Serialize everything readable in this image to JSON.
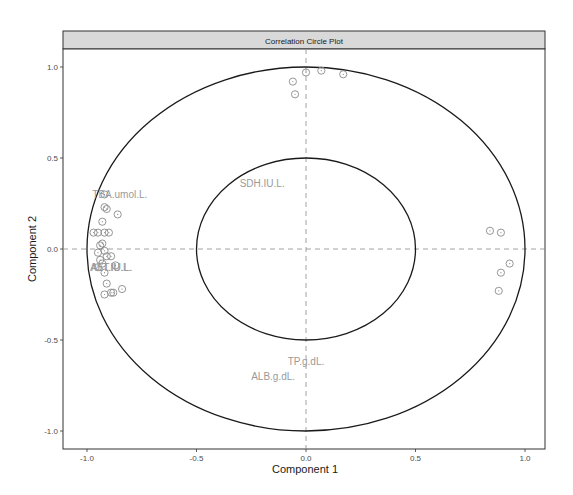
{
  "chart_data": {
    "type": "scatter",
    "title": "Correlation Circle Plot",
    "xlabel": "Component 1",
    "ylabel": "Component 2",
    "xlim": [
      -1.08,
      1.09
    ],
    "ylim": [
      -1.1,
      1.11
    ],
    "xticks": [
      -1.0,
      -0.5,
      0.0,
      0.5,
      1.0
    ],
    "yticks": [
      -1.0,
      -0.5,
      0.0,
      0.5,
      1.0
    ],
    "xtick_labels": [
      "-1.0",
      "-0.5",
      "0.0",
      "0.5",
      "1.0"
    ],
    "ytick_labels": [
      "-1.0",
      "-0.5",
      "0.0",
      "0.5",
      "1.0"
    ],
    "grid": false,
    "reference_lines": {
      "x": 0,
      "y": 0,
      "style": "dashed"
    },
    "circles": [
      {
        "radius": 1.0
      },
      {
        "radius": 0.5
      }
    ],
    "variable_labels": [
      {
        "label": "TBA.umol.L.",
        "x": -0.85,
        "y": 0.3
      },
      {
        "label": "AST.IU.L.",
        "x": -0.89,
        "y": -0.1
      },
      {
        "label": "ALT.IU.L.",
        "x": -0.89,
        "y": -0.1
      },
      {
        "label": "SDH.IU.L.",
        "x": -0.2,
        "y": 0.36
      },
      {
        "label": "TP.g.dL.",
        "x": 0.0,
        "y": -0.62
      },
      {
        "label": "ALB.g.dL.",
        "x": -0.15,
        "y": -0.7
      }
    ],
    "series": [
      {
        "name": "points",
        "marker": "circle-dot",
        "points": [
          [
            -0.92,
            0.3
          ],
          [
            -0.92,
            0.23
          ],
          [
            -0.91,
            0.22
          ],
          [
            -0.86,
            0.19
          ],
          [
            -0.93,
            0.15
          ],
          [
            -0.97,
            0.09
          ],
          [
            -0.95,
            0.09
          ],
          [
            -0.92,
            0.09
          ],
          [
            -0.9,
            0.09
          ],
          [
            -0.93,
            0.03
          ],
          [
            -0.94,
            0.02
          ],
          [
            -0.92,
            -0.01
          ],
          [
            -0.95,
            -0.02
          ],
          [
            -0.91,
            -0.04
          ],
          [
            -0.89,
            -0.04
          ],
          [
            -0.94,
            -0.06
          ],
          [
            -0.93,
            -0.08
          ],
          [
            -0.87,
            -0.09
          ],
          [
            -0.95,
            -0.1
          ],
          [
            -0.92,
            -0.13
          ],
          [
            -0.91,
            -0.19
          ],
          [
            -0.89,
            -0.24
          ],
          [
            -0.92,
            -0.25
          ],
          [
            -0.88,
            -0.24
          ],
          [
            -0.84,
            -0.22
          ],
          [
            -0.06,
            0.92
          ],
          [
            -0.05,
            0.85
          ],
          [
            0.0,
            0.97
          ],
          [
            0.07,
            0.98
          ],
          [
            0.17,
            0.96
          ],
          [
            0.84,
            0.1
          ],
          [
            0.89,
            0.09
          ],
          [
            0.93,
            -0.08
          ],
          [
            0.89,
            -0.13
          ],
          [
            0.88,
            -0.23
          ]
        ]
      }
    ]
  }
}
